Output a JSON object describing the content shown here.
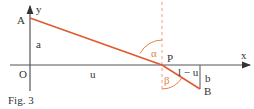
{
  "figure": {
    "caption": "Fig. 3",
    "colors": {
      "axis": "#555555",
      "path": "#e05a30",
      "normal": "#f0a07a",
      "angle": "#e8834a",
      "text": "#333333"
    },
    "labels": {
      "A": "A",
      "B": "B",
      "O": "O",
      "P": "P",
      "x": "x",
      "y": "y",
      "a": "a",
      "b": "b",
      "u": "u",
      "l_minus_u": "l − u",
      "alpha": "α",
      "beta": "β"
    }
  }
}
